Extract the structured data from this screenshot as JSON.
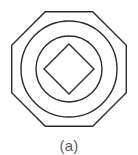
{
  "figure": {
    "caption": "(a)",
    "background_color": "#ffffff",
    "stroke_color": "#2b2b2b",
    "caption_color": "#5b5b5b",
    "shapes": [
      {
        "name": "outer-octagon",
        "type": "octagon",
        "center_x": 69,
        "center_y": 69,
        "radius": 62,
        "rotation_deg": 22.5,
        "stroke_width": 1.4
      },
      {
        "name": "outer-circle",
        "type": "circle",
        "center_x": 69,
        "center_y": 69,
        "radius": 48,
        "stroke_width": 1.4
      },
      {
        "name": "inner-circle",
        "type": "circle",
        "center_x": 69,
        "center_y": 69,
        "radius": 33,
        "stroke_width": 1.4
      },
      {
        "name": "inner-diamond",
        "type": "diamond",
        "center_x": 69,
        "center_y": 69,
        "radius": 25,
        "stroke_width": 1.4
      }
    ]
  }
}
